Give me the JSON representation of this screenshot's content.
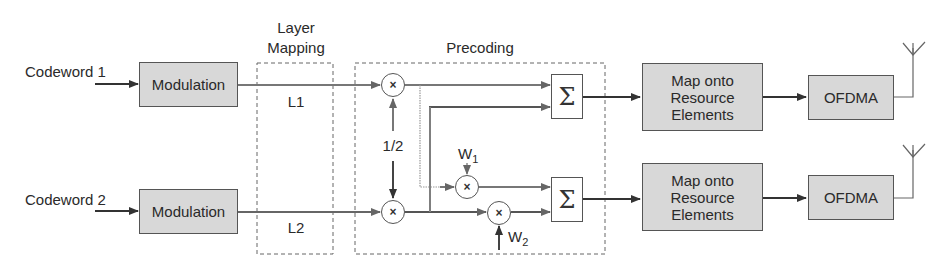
{
  "diagram": {
    "inputs": [
      {
        "label": "Codeword 1"
      },
      {
        "label": "Codeword 2"
      }
    ],
    "modulation": [
      {
        "label": "Modulation"
      },
      {
        "label": "Modulation"
      }
    ],
    "layer_mapping": {
      "title_line1": "Layer",
      "title_line2": "Mapping",
      "layers": [
        "L1",
        "L2"
      ]
    },
    "precoding": {
      "title": "Precoding",
      "multiplier_symbol": "×",
      "scale_label": "1/2",
      "weights": [
        {
          "base": "W",
          "sub": "1"
        },
        {
          "base": "W",
          "sub": "2"
        }
      ],
      "sum_symbol": "Σ"
    },
    "resource_mapping": [
      {
        "line1": "Map onto",
        "line2": "Resource",
        "line3": "Elements"
      },
      {
        "line1": "Map onto",
        "line2": "Resource",
        "line3": "Elements"
      }
    ],
    "ofdma": [
      {
        "label": "OFDMA"
      },
      {
        "label": "OFDMA"
      }
    ],
    "colors": {
      "block_fill": "#d8d8d8",
      "line": "#555555",
      "text": "#2a2a2a"
    }
  }
}
